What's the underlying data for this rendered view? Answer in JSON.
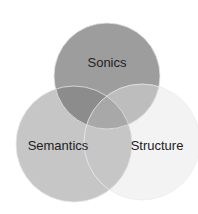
{
  "diagram": {
    "type": "venn",
    "sets": [
      {
        "label": "Sonics",
        "color": "#9d9d9d"
      },
      {
        "label": "Semantics",
        "color": "#c6c6c6"
      },
      {
        "label": "Structure",
        "color": "#f3f3f3"
      }
    ],
    "overlap_colors": {
      "sonics_semantics": "#8c8c8c",
      "sonics_structure": "#bdbdbd",
      "all": "#a8a8a8"
    }
  }
}
